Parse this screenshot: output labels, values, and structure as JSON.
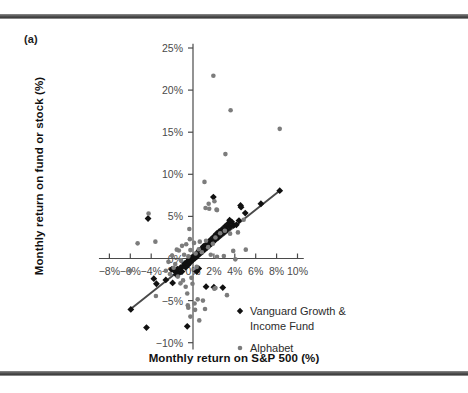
{
  "figure": {
    "panel_label": "(a)",
    "rule_color": "#4d4d4d"
  },
  "chart_data": {
    "type": "scatter",
    "title": "",
    "xlabel": "Monthly return on S&P 500 (%)",
    "ylabel": "Monthly return on fund or stock (%)",
    "xlim": [
      -9.0,
      10.6
    ],
    "ylim": [
      -10.8,
      25.5
    ],
    "xticks": [
      -8,
      -6,
      -4,
      -2,
      0,
      2,
      4,
      6,
      8,
      10
    ],
    "xtick_labels": [
      "−8%",
      "−6%",
      "−4%",
      "−2%",
      "0%",
      "2%",
      "4%",
      "6%",
      "8%",
      "10%"
    ],
    "yticks": [
      -10,
      -5,
      0,
      5,
      10,
      15,
      20,
      25
    ],
    "ytick_labels": [
      "−10%",
      "−5%",
      "0%",
      "5%",
      "10%",
      "15%",
      "20%",
      "25%"
    ],
    "grid": false,
    "axes_cross_at_origin": true,
    "legend_position": "inside-lower-right",
    "series": [
      {
        "name": "Vanguard Growth & Income Fund",
        "marker": "diamond",
        "color": "#111111",
        "points": [
          [
            -5.95,
            -6.05
          ],
          [
            -4.45,
            -8.2
          ],
          [
            -4.3,
            4.75
          ],
          [
            -3.75,
            -2.4
          ],
          [
            -3.5,
            -3.0
          ],
          [
            -2.6,
            -2.55
          ],
          [
            -2.05,
            -1.3
          ],
          [
            -1.95,
            -2.9
          ],
          [
            -1.75,
            -1.5
          ],
          [
            -1.6,
            -1.9
          ],
          [
            -1.5,
            -1.25
          ],
          [
            -1.35,
            -1.75
          ],
          [
            -1.2,
            -1.1
          ],
          [
            -1.05,
            -1.55
          ],
          [
            -0.95,
            -0.9
          ],
          [
            -0.8,
            -0.6
          ],
          [
            -0.7,
            -1.05
          ],
          [
            -0.6,
            -0.5
          ],
          [
            -0.5,
            -0.3
          ],
          [
            -0.45,
            -0.75
          ],
          [
            -0.35,
            -0.15
          ],
          [
            -0.25,
            -0.45
          ],
          [
            -0.15,
            0.1
          ],
          [
            -0.1,
            -0.25
          ],
          [
            0.0,
            0.15
          ],
          [
            0.05,
            -0.1
          ],
          [
            0.15,
            0.35
          ],
          [
            0.2,
            0.05
          ],
          [
            0.3,
            0.55
          ],
          [
            0.35,
            0.2
          ],
          [
            0.45,
            0.75
          ],
          [
            0.5,
            0.4
          ],
          [
            0.6,
            0.95
          ],
          [
            0.7,
            0.6
          ],
          [
            0.8,
            1.15
          ],
          [
            0.9,
            0.8
          ],
          [
            1.0,
            1.45
          ],
          [
            1.1,
            1.05
          ],
          [
            1.2,
            1.6
          ],
          [
            1.3,
            1.25
          ],
          [
            1.45,
            1.95
          ],
          [
            1.55,
            1.5
          ],
          [
            1.7,
            2.25
          ],
          [
            1.8,
            1.8
          ],
          [
            1.95,
            7.3
          ],
          [
            2.0,
            2.6
          ],
          [
            2.1,
            2.2
          ],
          [
            2.25,
            2.95
          ],
          [
            2.4,
            2.5
          ],
          [
            2.5,
            3.2
          ],
          [
            2.65,
            2.8
          ],
          [
            2.8,
            3.5
          ],
          [
            2.95,
            3.1
          ],
          [
            3.1,
            3.85
          ],
          [
            3.25,
            3.4
          ],
          [
            3.4,
            4.2
          ],
          [
            3.5,
            4.55
          ],
          [
            3.55,
            3.75
          ],
          [
            3.7,
            4.35
          ],
          [
            3.9,
            3.95
          ],
          [
            4.15,
            4.0
          ],
          [
            4.4,
            4.5
          ],
          [
            4.55,
            6.3
          ],
          [
            4.6,
            6.1
          ],
          [
            5.0,
            5.4
          ],
          [
            6.5,
            6.5
          ],
          [
            8.3,
            8.05
          ],
          [
            1.25,
            -3.35
          ],
          [
            2.0,
            -3.4
          ],
          [
            2.85,
            -3.45
          ],
          [
            -0.55,
            -8.05
          ],
          [
            0.35,
            -1.55
          ],
          [
            0.55,
            -1.2
          ]
        ]
      },
      {
        "name": "Alphabet",
        "marker": "circle",
        "color": "#7c7c7c",
        "points": [
          [
            1.95,
            21.7
          ],
          [
            3.6,
            17.6
          ],
          [
            8.3,
            15.4
          ],
          [
            3.1,
            12.4
          ],
          [
            1.1,
            9.1
          ],
          [
            1.5,
            6.5
          ],
          [
            1.2,
            6.0
          ],
          [
            2.05,
            6.8
          ],
          [
            2.25,
            5.8
          ],
          [
            2.3,
            5.75
          ],
          [
            1.55,
            5.9
          ],
          [
            -4.25,
            5.35
          ],
          [
            -3.6,
            2.0
          ],
          [
            -5.3,
            1.8
          ],
          [
            -0.35,
            3.5
          ],
          [
            -0.3,
            2.3
          ],
          [
            -0.65,
            1.7
          ],
          [
            -1.05,
            1.5
          ],
          [
            -1.35,
            0.95
          ],
          [
            -1.55,
            1.05
          ],
          [
            -0.25,
            1.0
          ],
          [
            0.1,
            1.85
          ],
          [
            0.65,
            2.0
          ],
          [
            1.25,
            2.1
          ],
          [
            0.55,
            1.1
          ],
          [
            -2.0,
            0.35
          ],
          [
            -2.35,
            -0.4
          ],
          [
            -1.15,
            -0.2
          ],
          [
            -0.85,
            0.45
          ],
          [
            -0.45,
            0.25
          ],
          [
            0.25,
            0.6
          ],
          [
            0.85,
            0.75
          ],
          [
            1.45,
            1.35
          ],
          [
            1.9,
            1.75
          ],
          [
            2.15,
            2.5
          ],
          [
            2.6,
            3.0
          ],
          [
            3.05,
            3.3
          ],
          [
            3.55,
            2.95
          ],
          [
            4.3,
            3.1
          ],
          [
            4.85,
            4.6
          ],
          [
            5.05,
            1.05
          ],
          [
            3.85,
            0.9
          ],
          [
            2.95,
            0.3
          ],
          [
            2.3,
            0.2
          ],
          [
            -6.0,
            -1.45
          ],
          [
            -3.55,
            -4.45
          ],
          [
            -2.6,
            -1.45
          ],
          [
            -2.2,
            -1.85
          ],
          [
            -1.85,
            -1.1
          ],
          [
            -1.45,
            -2.15
          ],
          [
            -0.95,
            -2.6
          ],
          [
            -0.7,
            -3.35
          ],
          [
            -0.55,
            -4.15
          ],
          [
            -0.5,
            -5.55
          ],
          [
            -0.45,
            -5.85
          ],
          [
            -0.25,
            -6.9
          ],
          [
            0.15,
            -5.35
          ],
          [
            0.2,
            -6.1
          ],
          [
            0.45,
            -4.85
          ],
          [
            0.6,
            -7.35
          ],
          [
            0.95,
            -5.0
          ],
          [
            1.15,
            -6.0
          ],
          [
            2.05,
            -3.6
          ],
          [
            2.15,
            -3.5
          ],
          [
            3.25,
            -4.35
          ],
          [
            -0.15,
            -2.3
          ],
          [
            0.35,
            -1.0
          ],
          [
            -1.7,
            -0.65
          ],
          [
            4.05,
            -0.1
          ],
          [
            1.7,
            0.45
          ],
          [
            -0.05,
            -3.0
          ],
          [
            -1.2,
            -2.95
          ]
        ]
      }
    ],
    "trendline": {
      "color": "#4a4a4a",
      "x_start": -6.05,
      "y_start": -6.1,
      "x_end": 8.35,
      "y_end": 8.1
    }
  },
  "legend": {
    "entries": [
      {
        "label_line1": "Vanguard Growth &",
        "label_line2": "Income Fund",
        "marker": "diamond"
      },
      {
        "label_line1": "Alphabet",
        "label_line2": "",
        "marker": "circle"
      }
    ]
  }
}
